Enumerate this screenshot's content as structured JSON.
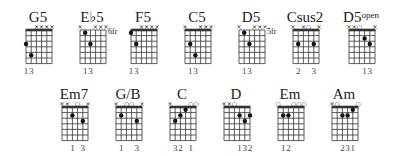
{
  "chords": [
    {
      "name": "G5",
      "sup": "",
      "x": 22,
      "y": 10,
      "nut": true,
      "fret_label": "",
      "markers": [
        "",
        "",
        "x",
        "x",
        "x",
        "x"
      ],
      "dots": [
        [
          0,
          3
        ],
        [
          1,
          5
        ]
      ],
      "fingers": [
        "1",
        "3",
        "",
        "",
        "",
        ""
      ]
    },
    {
      "name": "E♭5",
      "sup": "",
      "x": 76,
      "y": 10,
      "nut": false,
      "fret_label": "6fr",
      "markers": [
        "x",
        "",
        "",
        "x",
        "x",
        "x"
      ],
      "dots": [
        [
          1,
          1
        ],
        [
          2,
          3
        ]
      ],
      "fingers": [
        "",
        "1",
        "3",
        "",
        "",
        ""
      ]
    },
    {
      "name": "F5",
      "sup": "",
      "x": 127,
      "y": 10,
      "nut": true,
      "fret_label": "",
      "markers": [
        "",
        "",
        "x",
        "x",
        "x",
        "x"
      ],
      "dots": [
        [
          0,
          1
        ],
        [
          1,
          3
        ]
      ],
      "fingers": [
        "1",
        "3",
        "",
        "",
        "",
        ""
      ]
    },
    {
      "name": "C5",
      "sup": "",
      "x": 181,
      "y": 10,
      "nut": true,
      "fret_label": "",
      "markers": [
        "x",
        "",
        "",
        "x",
        "x",
        "x"
      ],
      "dots": [
        [
          1,
          3
        ],
        [
          2,
          5
        ]
      ],
      "fingers": [
        "",
        "1",
        "3",
        "",
        "",
        ""
      ]
    },
    {
      "name": "D5",
      "sup": "",
      "x": 235,
      "y": 10,
      "nut": false,
      "fret_label": "5fr",
      "markers": [
        "x",
        "",
        "",
        "x",
        "x",
        "x"
      ],
      "dots": [
        [
          1,
          1
        ],
        [
          2,
          3
        ]
      ],
      "fingers": [
        "",
        "1",
        "3",
        "",
        "",
        ""
      ]
    },
    {
      "name": "Csus2",
      "sup": "",
      "x": 289,
      "y": 10,
      "nut": true,
      "fret_label": "",
      "markers": [
        "x",
        "",
        "x",
        "o",
        "",
        "x"
      ],
      "dots": [
        [
          1,
          3
        ],
        [
          4,
          3
        ]
      ],
      "fingers": [
        "",
        "2",
        "",
        "",
        "3",
        ""
      ]
    },
    {
      "name": "D5",
      "sup": "open",
      "x": 345,
      "y": 10,
      "nut": true,
      "fret_label": "",
      "markers": [
        "x",
        "x",
        "o",
        "",
        "",
        "x"
      ],
      "dots": [
        [
          3,
          2
        ],
        [
          4,
          3
        ]
      ],
      "fingers": [
        "",
        "",
        "",
        "1",
        "3",
        ""
      ]
    },
    {
      "name": "Em7",
      "sup": "",
      "x": 58,
      "y": 87,
      "nut": true,
      "fret_label": "",
      "markers": [
        "x",
        "x",
        "",
        "o",
        "",
        "x"
      ],
      "dots": [
        [
          2,
          2
        ],
        [
          4,
          3
        ]
      ],
      "fingers": [
        "",
        "",
        "1",
        "",
        "3",
        ""
      ]
    },
    {
      "name": "G/B",
      "sup": "",
      "x": 112,
      "y": 87,
      "nut": true,
      "fret_label": "",
      "markers": [
        "x",
        "",
        "o",
        "o",
        "",
        "x"
      ],
      "dots": [
        [
          1,
          2
        ],
        [
          4,
          3
        ]
      ],
      "fingers": [
        "",
        "1",
        "",
        "",
        "3",
        ""
      ]
    },
    {
      "name": "C",
      "sup": "",
      "x": 166,
      "y": 87,
      "nut": true,
      "fret_label": "",
      "markers": [
        "x",
        "",
        "",
        "",
        "o",
        "o"
      ],
      "dots": [
        [
          1,
          3
        ],
        [
          2,
          2
        ],
        [
          3,
          1
        ]
      ],
      "fingers": [
        "",
        "3",
        "2",
        "",
        "1",
        ""
      ],
      "fingers_raw": "32 1"
    },
    {
      "name": "D",
      "sup": "",
      "x": 220,
      "y": 87,
      "nut": true,
      "fret_label": "",
      "markers": [
        "x",
        "x",
        "o",
        "",
        "",
        ""
      ],
      "dots": [
        [
          3,
          2
        ],
        [
          4,
          3
        ],
        [
          5,
          2
        ]
      ],
      "fingers": [
        "",
        "",
        "",
        "1",
        "3",
        "2"
      ]
    },
    {
      "name": "Em",
      "sup": "",
      "x": 274,
      "y": 87,
      "nut": true,
      "fret_label": "",
      "markers": [
        "o",
        "",
        "",
        "o",
        "o",
        "o"
      ],
      "dots": [
        [
          1,
          2
        ],
        [
          2,
          2
        ]
      ],
      "fingers": [
        "",
        "1",
        "2",
        "",
        "",
        ""
      ]
    },
    {
      "name": "Am",
      "sup": "",
      "x": 328,
      "y": 87,
      "nut": true,
      "fret_label": "",
      "markers": [
        "x",
        "o",
        "",
        "",
        "",
        "o"
      ],
      "dots": [
        [
          2,
          2
        ],
        [
          3,
          2
        ],
        [
          4,
          1
        ]
      ],
      "fingers": [
        "",
        "",
        "2",
        "3",
        "1",
        ""
      ]
    }
  ],
  "finger_labels": [
    "13",
    "13",
    "13",
    "13",
    "13",
    "2  3",
    "13",
    "1  3",
    "1  3",
    "32 1",
    "132",
    "12",
    "231"
  ],
  "colors": {
    "ink": "#222222",
    "grid": "#333333",
    "background": "#ffffff"
  }
}
